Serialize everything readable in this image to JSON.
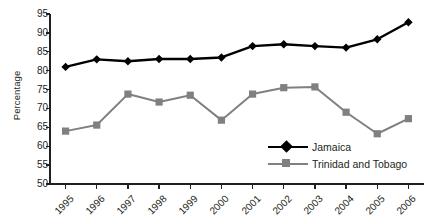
{
  "chart_data": {
    "type": "line",
    "title": "",
    "subtitle": "",
    "xlabel": "",
    "ylabel": "Percentage",
    "categories": [
      "1995",
      "1996",
      "1997",
      "1998",
      "1999",
      "2000",
      "2001",
      "2002",
      "2003",
      "2004",
      "2005",
      "2006"
    ],
    "ylim": [
      50,
      95
    ],
    "yticks": [
      "50",
      "55",
      "60",
      "65",
      "70",
      "75",
      "80",
      "85",
      "90",
      "95"
    ],
    "ytick_values": [
      50,
      55,
      60,
      65,
      70,
      75,
      80,
      85,
      90,
      95
    ],
    "grid": false,
    "legend_position": "inside-bottom-right",
    "series": [
      {
        "name": "Jamaica",
        "marker": "diamond",
        "color": "#000000",
        "values": [
          81.0,
          83.0,
          82.5,
          83.1,
          83.1,
          83.5,
          86.5,
          87.0,
          86.5,
          86.1,
          88.3,
          92.8
        ]
      },
      {
        "name": "Trinidad and Tobago",
        "marker": "square",
        "color": "#808080",
        "values": [
          64.0,
          65.6,
          73.8,
          71.7,
          73.5,
          66.9,
          73.8,
          75.5,
          75.7,
          69.0,
          63.3,
          67.3
        ]
      }
    ]
  },
  "legend": {
    "items": [
      {
        "label": "Jamaica"
      },
      {
        "label": "Trinidad and Tobago"
      }
    ]
  },
  "colors": {
    "series_1": "#000000",
    "series_2": "#808080",
    "axis": "#231f20",
    "background": "#ffffff"
  }
}
